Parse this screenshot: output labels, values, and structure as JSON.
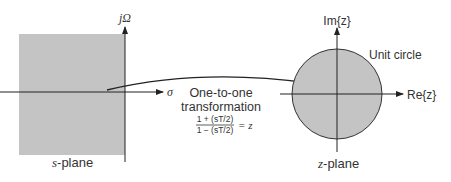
{
  "s_plane": {
    "label_var": "s",
    "label_rest": "-plane",
    "vertical_axis_label": "jΩ",
    "horizontal_axis_label": "σ",
    "fill_color": "#c4c4c4"
  },
  "transformation": {
    "line1": "One-to-one",
    "line2": "transformation",
    "numerator": "1 + (sT/2)",
    "denominator": "1 − (sT/2)",
    "equals": "= z"
  },
  "z_plane": {
    "label_var": "z",
    "label_rest": "-plane",
    "vertical_axis_label": "Im{z}",
    "horizontal_axis_label": "Re{z}",
    "circle_label": "Unit circle",
    "fill_color": "#c4c4c4"
  }
}
